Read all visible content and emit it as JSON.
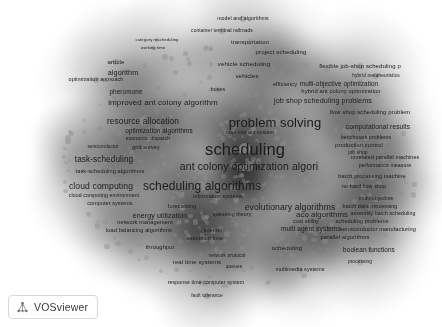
{
  "app": {
    "name": "VOSviewer",
    "view_type": "density-visualization",
    "canvas": {
      "width": 442,
      "height": 327,
      "background": "#ffffff"
    }
  },
  "logo": {
    "wordmark": "VOSviewer",
    "icon": "network-nodes-icon"
  },
  "palette": {
    "background": "#ffffff",
    "label_color": "#1b1b1b",
    "dot_color": "#8d8d8d",
    "density_low": "#ffffff",
    "density_high": "#303030"
  },
  "chart_data": {
    "type": "scatter",
    "title": "",
    "xlabel": "",
    "ylabel": "",
    "legend": "none",
    "grid": false,
    "note": "VOSviewer grayscale density map of term co-occurrence; x/y are layout coordinates in pixels, weight drives label font size.",
    "terms": [
      {
        "label": "model and algorithms",
        "x": 243,
        "y": 19,
        "size": 5.2,
        "weight": 0.3
      },
      {
        "label": "container terminal railroads",
        "x": 222,
        "y": 31,
        "size": 4.9,
        "weight": 0.27
      },
      {
        "label": "transportation",
        "x": 250,
        "y": 42,
        "size": 6.0,
        "weight": 0.38
      },
      {
        "label": "category rescheduling",
        "x": 157,
        "y": 40,
        "size": 4.2,
        "weight": 0.2
      },
      {
        "label": "working time",
        "x": 153,
        "y": 48,
        "size": 4.2,
        "weight": 0.2
      },
      {
        "label": "project scheduling",
        "x": 281,
        "y": 52,
        "size": 6.1,
        "weight": 0.39
      },
      {
        "label": "article",
        "x": 116,
        "y": 62,
        "size": 6.2,
        "weight": 0.4
      },
      {
        "label": "vehicle scheduling",
        "x": 244,
        "y": 64,
        "size": 6.2,
        "weight": 0.4
      },
      {
        "label": "flexible job-shop scheduling p",
        "x": 360,
        "y": 66,
        "size": 6.0,
        "weight": 0.38
      },
      {
        "label": "algorithm",
        "x": 123,
        "y": 73,
        "size": 7.2,
        "weight": 0.5
      },
      {
        "label": "vehicles",
        "x": 247,
        "y": 76,
        "size": 6.2,
        "weight": 0.4
      },
      {
        "label": "hybrid metaheuristics",
        "x": 376,
        "y": 76,
        "size": 4.8,
        "weight": 0.26
      },
      {
        "label": "optimization approach",
        "x": 96,
        "y": 80,
        "size": 5.4,
        "weight": 0.32
      },
      {
        "label": "efficiency",
        "x": 285,
        "y": 85,
        "size": 5.6,
        "weight": 0.34
      },
      {
        "label": "multi-objective optimization",
        "x": 339,
        "y": 84,
        "size": 6.3,
        "weight": 0.42
      },
      {
        "label": "buses",
        "x": 218,
        "y": 90,
        "size": 5.2,
        "weight": 0.3
      },
      {
        "label": "pheromone",
        "x": 126,
        "y": 92,
        "size": 6.4,
        "weight": 0.43
      },
      {
        "label": "hybrid ant colony optimization",
        "x": 341,
        "y": 92,
        "size": 5.8,
        "weight": 0.36
      },
      {
        "label": "improved ant colony algorithm",
        "x": 163,
        "y": 103,
        "size": 8.0,
        "weight": 0.58
      },
      {
        "label": "job shop scheduling problems",
        "x": 323,
        "y": 101,
        "size": 7.2,
        "weight": 0.5
      },
      {
        "label": "flow shop scheduling problem",
        "x": 370,
        "y": 113,
        "size": 5.9,
        "weight": 0.37
      },
      {
        "label": "problem solving",
        "x": 275,
        "y": 122,
        "size": 13.0,
        "weight": 0.88
      },
      {
        "label": "resource allocation",
        "x": 143,
        "y": 121,
        "size": 8.4,
        "weight": 0.62
      },
      {
        "label": "computational results",
        "x": 378,
        "y": 127,
        "size": 6.6,
        "weight": 0.45
      },
      {
        "label": "max-min ant system",
        "x": 250,
        "y": 133,
        "size": 5.2,
        "weight": 0.3
      },
      {
        "label": "optimization algorithms",
        "x": 159,
        "y": 131,
        "size": 6.4,
        "weight": 0.43
      },
      {
        "label": "benchmark problems",
        "x": 366,
        "y": 138,
        "size": 5.2,
        "weight": 0.3
      },
      {
        "label": "economic dispatch",
        "x": 148,
        "y": 139,
        "size": 5.2,
        "weight": 0.3
      },
      {
        "label": "production control",
        "x": 359,
        "y": 146,
        "size": 5.8,
        "weight": 0.36
      },
      {
        "label": "scheduling",
        "x": 245,
        "y": 149,
        "size": 16.5,
        "weight": 1.0
      },
      {
        "label": "semiconductor",
        "x": 103,
        "y": 147,
        "size": 4.6,
        "weight": 0.24
      },
      {
        "label": "grid survey",
        "x": 146,
        "y": 148,
        "size": 5.4,
        "weight": 0.32
      },
      {
        "label": "job shop",
        "x": 358,
        "y": 153,
        "size": 4.9,
        "weight": 0.27
      },
      {
        "label": "unrelated parallel machines",
        "x": 385,
        "y": 158,
        "size": 5.4,
        "weight": 0.32
      },
      {
        "label": "task-scheduling",
        "x": 104,
        "y": 160,
        "size": 8.2,
        "weight": 0.6
      },
      {
        "label": "ant colony optimization algori",
        "x": 249,
        "y": 166,
        "size": 10.5,
        "weight": 0.74
      },
      {
        "label": "performance measure",
        "x": 385,
        "y": 166,
        "size": 5.2,
        "weight": 0.3
      },
      {
        "label": "task-scheduling algorithms",
        "x": 110,
        "y": 172,
        "size": 5.6,
        "weight": 0.34
      },
      {
        "label": "batch processing machine",
        "x": 372,
        "y": 177,
        "size": 5.6,
        "weight": 0.34
      },
      {
        "label": "scheduling algorithms",
        "x": 202,
        "y": 186,
        "size": 12.0,
        "weight": 0.84
      },
      {
        "label": "cloud computing",
        "x": 101,
        "y": 186,
        "size": 8.6,
        "weight": 0.64
      },
      {
        "label": "no-hard flow shop",
        "x": 364,
        "y": 187,
        "size": 5.4,
        "weight": 0.32
      },
      {
        "label": "cloud computing environment",
        "x": 104,
        "y": 196,
        "size": 5.2,
        "weight": 0.3
      },
      {
        "label": "information systems",
        "x": 218,
        "y": 197,
        "size": 5.4,
        "weight": 0.32
      },
      {
        "label": "multi-objective",
        "x": 376,
        "y": 199,
        "size": 5.2,
        "weight": 0.3
      },
      {
        "label": "computer systems",
        "x": 110,
        "y": 204,
        "size": 5.4,
        "weight": 0.32
      },
      {
        "label": "forecasting",
        "x": 182,
        "y": 207,
        "size": 5.6,
        "weight": 0.34
      },
      {
        "label": "evolutionary algorithms",
        "x": 290,
        "y": 207,
        "size": 8.6,
        "weight": 0.64
      },
      {
        "label": "batch data processing",
        "x": 370,
        "y": 207,
        "size": 5.4,
        "weight": 0.32
      },
      {
        "label": "energy utilization",
        "x": 160,
        "y": 215,
        "size": 7.0,
        "weight": 0.48
      },
      {
        "label": "queueing theory",
        "x": 232,
        "y": 215,
        "size": 5.2,
        "weight": 0.3
      },
      {
        "label": "aco algorithms",
        "x": 322,
        "y": 215,
        "size": 7.8,
        "weight": 0.56
      },
      {
        "label": "assembly batch scheduling",
        "x": 383,
        "y": 214,
        "size": 5.2,
        "weight": 0.3
      },
      {
        "label": "network management",
        "x": 145,
        "y": 223,
        "size": 5.6,
        "weight": 0.34
      },
      {
        "label": "cost ability",
        "x": 306,
        "y": 222,
        "size": 5.2,
        "weight": 0.3
      },
      {
        "label": "scheduling problems",
        "x": 362,
        "y": 222,
        "size": 5.6,
        "weight": 0.34
      },
      {
        "label": "multi agent systems",
        "x": 311,
        "y": 229,
        "size": 6.6,
        "weight": 0.45
      },
      {
        "label": "load balancing algorithms",
        "x": 139,
        "y": 231,
        "size": 5.6,
        "weight": 0.34
      },
      {
        "label": "internet",
        "x": 213,
        "y": 231,
        "size": 5.2,
        "weight": 0.3
      },
      {
        "label": "semiconductor manufacturing",
        "x": 378,
        "y": 230,
        "size": 5.6,
        "weight": 0.34
      },
      {
        "label": "execution time",
        "x": 205,
        "y": 239,
        "size": 5.4,
        "weight": 0.32
      },
      {
        "label": "parallel algorithms",
        "x": 345,
        "y": 238,
        "size": 5.8,
        "weight": 0.36
      },
      {
        "label": "throughput",
        "x": 160,
        "y": 248,
        "size": 5.8,
        "weight": 0.36
      },
      {
        "label": "scheduling",
        "x": 287,
        "y": 248,
        "size": 6.2,
        "weight": 0.4
      },
      {
        "label": "boolean functions",
        "x": 369,
        "y": 250,
        "size": 6.4,
        "weight": 0.43
      },
      {
        "label": "network protocol",
        "x": 227,
        "y": 256,
        "size": 4.8,
        "weight": 0.26
      },
      {
        "label": "real time systems",
        "x": 197,
        "y": 262,
        "size": 6.0,
        "weight": 0.38
      },
      {
        "label": "processing",
        "x": 360,
        "y": 262,
        "size": 4.8,
        "weight": 0.26
      },
      {
        "label": "queues",
        "x": 234,
        "y": 267,
        "size": 4.8,
        "weight": 0.26
      },
      {
        "label": "multimedia systems",
        "x": 300,
        "y": 270,
        "size": 5.4,
        "weight": 0.32
      },
      {
        "label": "response time computer system",
        "x": 206,
        "y": 283,
        "size": 5.2,
        "weight": 0.3
      },
      {
        "label": "fault tolerance",
        "x": 207,
        "y": 296,
        "size": 4.8,
        "weight": 0.26
      }
    ]
  }
}
